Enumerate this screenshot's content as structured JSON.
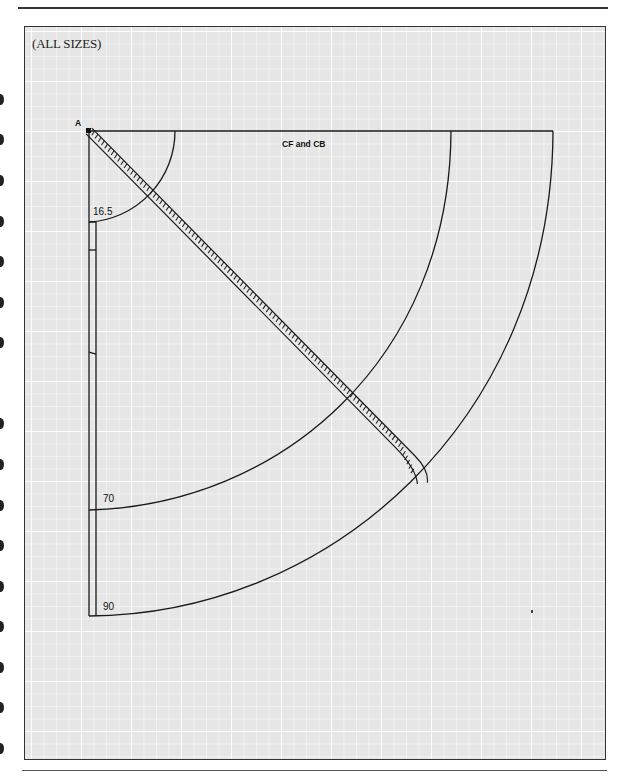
{
  "diagram": {
    "header_label": "(ALL SIZES)",
    "point_label": "A",
    "edge_label": "CF and CB",
    "measurements": [
      {
        "id": "waist",
        "label": "16.5"
      },
      {
        "id": "skirt-length-1",
        "label": "70"
      },
      {
        "id": "skirt-length-2",
        "label": "90"
      }
    ],
    "colors": {
      "line": "#1a1a1a",
      "grid_background": "#e6e6e6",
      "grid_line": "#ffffff"
    }
  }
}
